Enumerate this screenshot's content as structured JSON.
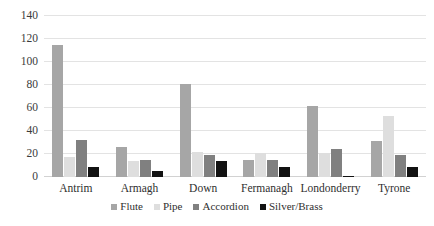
{
  "chart_data": {
    "type": "bar",
    "title": "",
    "subtitle": "",
    "xlabel": "",
    "ylabel": "",
    "categories": [
      "Antrim",
      "Armagh",
      "Down",
      "Fermanagh",
      "Londonderry",
      "Tyrone"
    ],
    "series": [
      {
        "name": "Flute",
        "color": "#a6a6a6",
        "values": [
          115,
          26,
          81,
          15,
          62,
          31
        ]
      },
      {
        "name": "Pipe",
        "color": "#dedede",
        "values": [
          17,
          14,
          22,
          21,
          21,
          53
        ]
      },
      {
        "name": "Accordion",
        "color": "#808080",
        "values": [
          32,
          15,
          19,
          15,
          24,
          19
        ]
      },
      {
        "name": "Silver/Brass",
        "color": "#121212",
        "values": [
          9,
          5,
          14,
          9,
          1,
          9
        ]
      }
    ],
    "ylim": [
      0,
      140
    ],
    "yticks": [
      0,
      20,
      40,
      60,
      80,
      100,
      120,
      140
    ],
    "ytick_labels": [
      "0",
      "20",
      "40",
      "60",
      "80",
      "100",
      "120",
      "140"
    ],
    "grid": true,
    "grid_axis": "y",
    "legend_position": "bottom",
    "legend_entries": [
      "Flute",
      "Pipe",
      "Accordion",
      "Silver/Brass"
    ]
  }
}
